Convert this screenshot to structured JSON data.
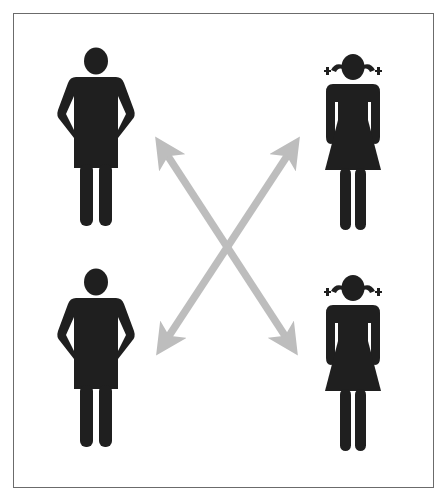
{
  "diagram": {
    "title": "Pairings between boys and girls",
    "colors": {
      "figure": "#1f1f1f",
      "arrow": "#bdbdbd",
      "frame": "#6b6b6b",
      "background": "#ffffff"
    },
    "nodes": [
      {
        "id": "boy-top",
        "label": "Boy (top-left)",
        "type": "boy-icon"
      },
      {
        "id": "girl-top",
        "label": "Girl (top-right)",
        "type": "girl-icon"
      },
      {
        "id": "boy-bottom",
        "label": "Boy (bottom-left)",
        "type": "boy-icon"
      },
      {
        "id": "girl-bottom",
        "label": "Girl (bottom-right)",
        "type": "girl-icon"
      }
    ],
    "edges": [
      {
        "from": "boy-bottom",
        "to": "girl-top",
        "style": "double-headed-arrow"
      },
      {
        "from": "girl-bottom",
        "to": "boy-top",
        "style": "double-headed-arrow"
      }
    ]
  }
}
